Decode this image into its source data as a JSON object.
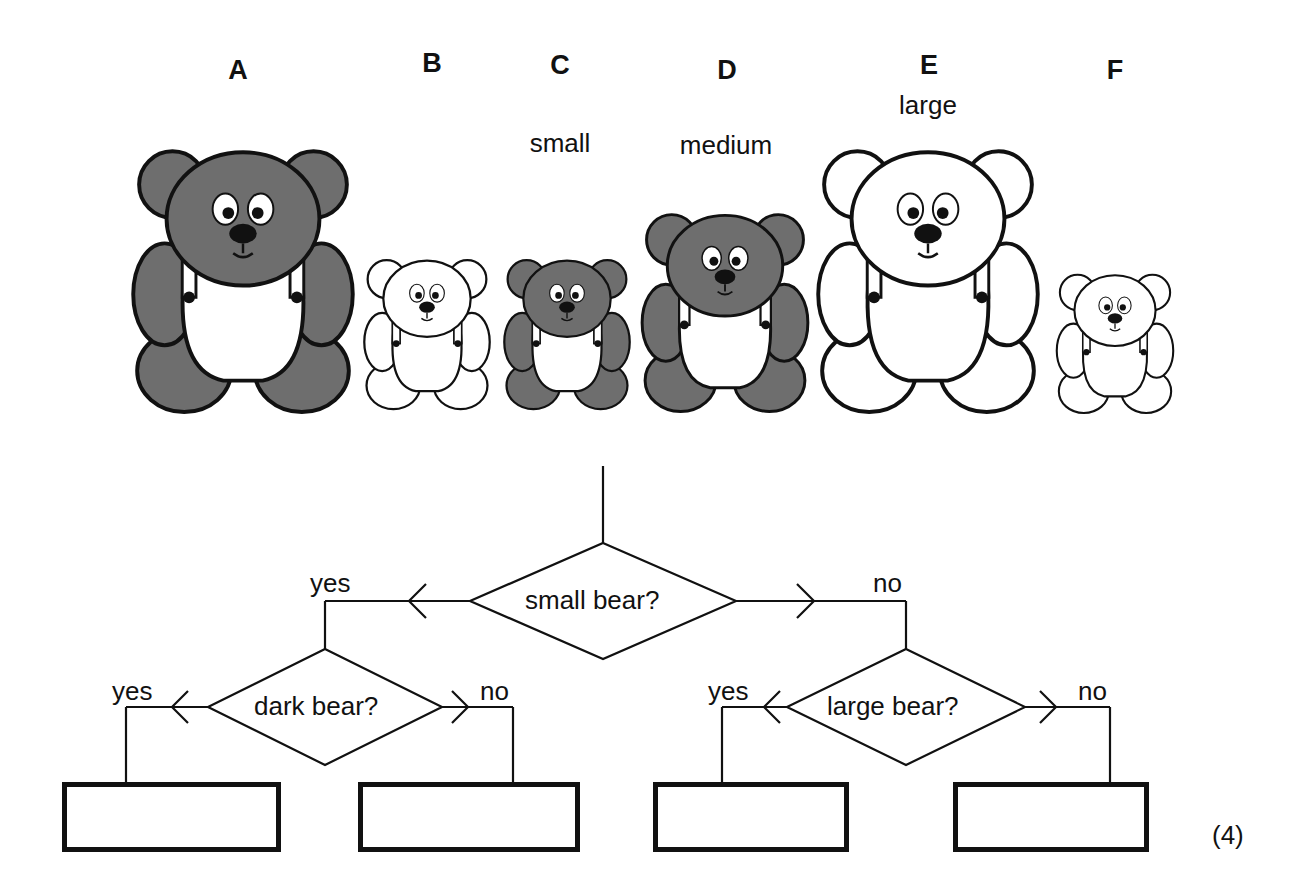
{
  "bears": [
    {
      "letter": "A",
      "size_label": "",
      "shade": "dark",
      "x": 243,
      "y": 125,
      "scale": 1.0
    },
    {
      "letter": "B",
      "size_label": "",
      "shade": "light",
      "x": 427,
      "y": 248,
      "scale": 0.56
    },
    {
      "letter": "C",
      "size_label": "small",
      "shade": "dark",
      "x": 563,
      "y": 248,
      "scale": 0.56
    },
    {
      "letter": "D",
      "size_label": "medium",
      "shade": "dark",
      "x": 727,
      "y": 200,
      "scale": 0.76
    },
    {
      "letter": "E",
      "size_label": "large",
      "shade": "light",
      "x": 930,
      "y": 125,
      "scale": 1.0
    },
    {
      "letter": "F",
      "size_label": "",
      "shade": "light",
      "x": 1115,
      "y": 255,
      "scale": 0.54
    }
  ],
  "flowchart": {
    "root": {
      "question": "small bear?",
      "yes": "yes",
      "no": "no"
    },
    "left": {
      "question": "dark bear?",
      "yes": "yes",
      "no": "no"
    },
    "right": {
      "question": "large bear?",
      "yes": "yes",
      "no": "no"
    },
    "answer_boxes": [
      "",
      "",
      "",
      ""
    ]
  },
  "marks": "(4)",
  "colors": {
    "dark_fur": "#6e6e6e",
    "line": "#111111"
  }
}
